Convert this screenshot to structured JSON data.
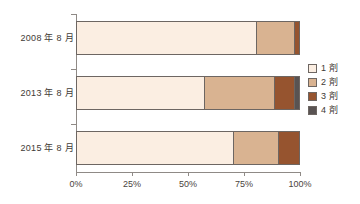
{
  "chart_data": {
    "type": "bar",
    "orientation": "horizontal",
    "stacked": true,
    "normalized_percent": true,
    "title": "",
    "subtitle": "",
    "xlabel": "",
    "ylabel": "",
    "xlim": [
      0,
      100
    ],
    "xticks": [
      0,
      25,
      50,
      75,
      100
    ],
    "xticklabels": [
      "0%",
      "25%",
      "50%",
      "75%",
      "100%"
    ],
    "grid": false,
    "legend_position": "right",
    "categories": [
      "2008 年 8 月",
      "2013 年 8 月",
      "2015 年 8 月"
    ],
    "series": [
      {
        "name": "1 剤",
        "color": "#fbeee2",
        "values": [
          80.4,
          57.0,
          70.0
        ]
      },
      {
        "name": "2 剤",
        "color": "#d9b391",
        "values": [
          17.1,
          31.5,
          20.0
        ]
      },
      {
        "name": "3 剤",
        "color": "#96542f",
        "values": [
          2.5,
          9.0,
          10.0
        ]
      },
      {
        "name": "4 剤",
        "color": "#595352",
        "values": [
          0.0,
          2.5,
          0.0
        ]
      }
    ]
  },
  "axis": {
    "tick_labels": [
      "0%",
      "25%",
      "50%",
      "75%",
      "100%"
    ]
  },
  "legend": {
    "items": [
      {
        "label": "1 剤",
        "color": "#fbeee2"
      },
      {
        "label": "2 剤",
        "color": "#d9b391"
      },
      {
        "label": "3 剤",
        "color": "#96542f"
      },
      {
        "label": "4 剤",
        "color": "#595352"
      }
    ]
  },
  "colors": {
    "axis": "#8f8a86",
    "segment_border": "#6d6662",
    "text": "#3f3a36",
    "background": "#ffffff"
  }
}
